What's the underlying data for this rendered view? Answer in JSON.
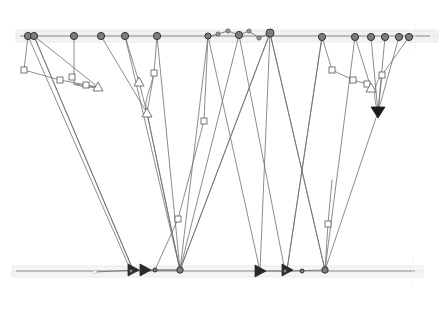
{
  "canvas": {
    "width": 440,
    "height": 311,
    "background": "#ffffff",
    "title": "node-link timeline graph"
  },
  "style": {
    "axis_fill": "#efefef",
    "axis_stroke": "#d8d8d8",
    "axis_center_line": "#8a8a8a",
    "edge_color": "#707070",
    "edge_width": 0.8,
    "node_fill": "#7d7d7d",
    "node_stroke": "#333333",
    "marker_fill": "#ffffff",
    "marker_stroke": "#555555",
    "arrow_fill": "#1a1a1a",
    "glow_color": "#f4f4f4"
  },
  "axes": [
    {
      "name": "top-axis",
      "y": 36,
      "x1": 20,
      "x2": 430,
      "band_top": 30,
      "band_height": 12,
      "label": ""
    },
    {
      "name": "bottom-axis",
      "y": 271,
      "x1": 16,
      "x2": 415,
      "band_top": 266,
      "band_height": 11,
      "label": ""
    }
  ],
  "top_nodes": [
    {
      "id": "t1",
      "x": 28,
      "y": 36,
      "r": 3.6
    },
    {
      "id": "t2",
      "x": 34,
      "y": 36,
      "r": 3.6
    },
    {
      "id": "t3",
      "x": 74,
      "y": 36,
      "r": 3.6
    },
    {
      "id": "t4",
      "x": 101,
      "y": 36,
      "r": 3.6
    },
    {
      "id": "t5",
      "x": 125,
      "y": 36,
      "r": 3.6
    },
    {
      "id": "t6",
      "x": 157,
      "y": 36,
      "r": 3.6
    },
    {
      "id": "t7",
      "x": 208,
      "y": 36,
      "r": 3.0
    },
    {
      "id": "t8",
      "x": 239,
      "y": 35,
      "r": 3.6
    },
    {
      "id": "t9",
      "x": 270,
      "y": 33,
      "r": 4.0
    },
    {
      "id": "t10",
      "x": 322,
      "y": 37,
      "r": 3.6
    },
    {
      "id": "t11",
      "x": 355,
      "y": 37,
      "r": 3.6
    },
    {
      "id": "t12",
      "x": 371,
      "y": 37,
      "r": 3.6
    },
    {
      "id": "t13",
      "x": 385,
      "y": 37,
      "r": 3.6
    },
    {
      "id": "t14",
      "x": 399,
      "y": 37,
      "r": 3.6
    },
    {
      "id": "t15",
      "x": 409,
      "y": 37,
      "r": 3.6
    }
  ],
  "bottom_nodes": [
    {
      "id": "b1",
      "x": 95,
      "y": 272,
      "r": 1.8,
      "shape": "open-circle"
    },
    {
      "id": "b2",
      "x": 131,
      "y": 271,
      "r": 2.0,
      "shape": "circle"
    },
    {
      "id": "b3",
      "x": 155,
      "y": 270,
      "r": 2.0,
      "shape": "circle"
    },
    {
      "id": "b4",
      "x": 180,
      "y": 270,
      "r": 3.2,
      "shape": "circle"
    },
    {
      "id": "b5",
      "x": 285,
      "y": 271,
      "r": 2.0,
      "shape": "circle"
    },
    {
      "id": "b6",
      "x": 302,
      "y": 271,
      "r": 2.0,
      "shape": "circle"
    },
    {
      "id": "b7",
      "x": 325,
      "y": 270,
      "r": 3.2,
      "shape": "circle"
    }
  ],
  "square_markers": [
    {
      "id": "s1",
      "x": 24,
      "y": 70
    },
    {
      "id": "s2",
      "x": 72,
      "y": 77
    },
    {
      "id": "s3",
      "x": 154,
      "y": 73
    },
    {
      "id": "s4",
      "x": 204,
      "y": 121
    },
    {
      "id": "s5",
      "x": 178,
      "y": 219
    },
    {
      "id": "s6",
      "x": 328,
      "y": 224
    },
    {
      "id": "s7",
      "x": 332,
      "y": 70
    },
    {
      "id": "s8",
      "x": 382,
      "y": 75
    },
    {
      "id": "s9",
      "x": 60,
      "y": 80
    },
    {
      "id": "s10",
      "x": 86,
      "y": 85
    },
    {
      "id": "s11",
      "x": 353,
      "y": 80
    },
    {
      "id": "s12",
      "x": 367,
      "y": 84
    }
  ],
  "triangle_markers": [
    {
      "id": "tr1",
      "x": 98,
      "y": 87,
      "style": "open"
    },
    {
      "id": "tr2",
      "x": 147,
      "y": 113,
      "style": "open"
    },
    {
      "id": "tr3",
      "x": 139,
      "y": 82,
      "style": "open"
    },
    {
      "id": "tr4",
      "x": 371,
      "y": 88,
      "style": "open"
    },
    {
      "id": "tr5",
      "x": 378,
      "y": 112,
      "style": "filled"
    },
    {
      "id": "tr6",
      "x": 133,
      "y": 270,
      "style": "filled-left"
    },
    {
      "id": "tr7",
      "x": 145,
      "y": 270,
      "style": "filled-left"
    },
    {
      "id": "tr8",
      "x": 260,
      "y": 271,
      "style": "filled-left"
    },
    {
      "id": "tr9",
      "x": 287,
      "y": 270,
      "style": "filled-left"
    }
  ],
  "edges": [
    {
      "from": [
        28,
        36
      ],
      "to": [
        24,
        70
      ]
    },
    {
      "from": [
        24,
        70
      ],
      "to": [
        60,
        80
      ]
    },
    {
      "from": [
        60,
        80
      ],
      "to": [
        86,
        85
      ]
    },
    {
      "from": [
        86,
        85
      ],
      "to": [
        98,
        87
      ]
    },
    {
      "from": [
        34,
        36
      ],
      "to": [
        98,
        87
      ]
    },
    {
      "from": [
        34,
        36
      ],
      "to": [
        133,
        270
      ]
    },
    {
      "from": [
        28,
        36
      ],
      "to": [
        131,
        271
      ]
    },
    {
      "from": [
        74,
        36
      ],
      "to": [
        74,
        84
      ]
    },
    {
      "from": [
        74,
        84
      ],
      "to": [
        98,
        87
      ]
    },
    {
      "from": [
        101,
        36
      ],
      "to": [
        147,
        113
      ]
    },
    {
      "from": [
        125,
        36
      ],
      "to": [
        139,
        82
      ]
    },
    {
      "from": [
        139,
        82
      ],
      "to": [
        147,
        113
      ]
    },
    {
      "from": [
        157,
        36
      ],
      "to": [
        154,
        73
      ]
    },
    {
      "from": [
        154,
        73
      ],
      "to": [
        147,
        113
      ]
    },
    {
      "from": [
        147,
        113
      ],
      "to": [
        180,
        270
      ]
    },
    {
      "from": [
        125,
        36
      ],
      "to": [
        180,
        270
      ]
    },
    {
      "from": [
        157,
        36
      ],
      "to": [
        180,
        270
      ]
    },
    {
      "from": [
        208,
        36
      ],
      "to": [
        180,
        270
      ]
    },
    {
      "from": [
        208,
        36
      ],
      "to": [
        204,
        121
      ]
    },
    {
      "from": [
        204,
        121
      ],
      "to": [
        178,
        219
      ]
    },
    {
      "from": [
        178,
        219
      ],
      "to": [
        155,
        270
      ]
    },
    {
      "from": [
        270,
        33
      ],
      "to": [
        180,
        270
      ]
    },
    {
      "from": [
        270,
        33
      ],
      "to": [
        260,
        271
      ]
    },
    {
      "from": [
        239,
        35
      ],
      "to": [
        285,
        271
      ]
    },
    {
      "from": [
        322,
        37
      ],
      "to": [
        332,
        70
      ]
    },
    {
      "from": [
        332,
        70
      ],
      "to": [
        353,
        80
      ]
    },
    {
      "from": [
        353,
        80
      ],
      "to": [
        367,
        84
      ]
    },
    {
      "from": [
        367,
        84
      ],
      "to": [
        371,
        88
      ]
    },
    {
      "from": [
        355,
        37
      ],
      "to": [
        371,
        88
      ]
    },
    {
      "from": [
        371,
        37
      ],
      "to": [
        378,
        112
      ]
    },
    {
      "from": [
        385,
        37
      ],
      "to": [
        378,
        112
      ]
    },
    {
      "from": [
        399,
        37
      ],
      "to": [
        378,
        112
      ]
    },
    {
      "from": [
        409,
        37
      ],
      "to": [
        382,
        75
      ]
    },
    {
      "from": [
        382,
        75
      ],
      "to": [
        378,
        112
      ]
    },
    {
      "from": [
        322,
        37
      ],
      "to": [
        287,
        270
      ]
    },
    {
      "from": [
        355,
        37
      ],
      "to": [
        325,
        270
      ]
    },
    {
      "from": [
        378,
        112
      ],
      "to": [
        325,
        270
      ]
    },
    {
      "from": [
        328,
        224
      ],
      "to": [
        325,
        270
      ]
    },
    {
      "from": [
        328,
        224
      ],
      "to": [
        332,
        180
      ]
    },
    {
      "from": [
        270,
        33
      ],
      "to": [
        325,
        270
      ]
    },
    {
      "from": [
        285,
        271
      ],
      "to": [
        325,
        270
      ]
    },
    {
      "from": [
        260,
        271
      ],
      "to": [
        285,
        271
      ]
    },
    {
      "from": [
        133,
        270
      ],
      "to": [
        180,
        270
      ]
    },
    {
      "from": [
        145,
        270
      ],
      "to": [
        180,
        270
      ]
    },
    {
      "from": [
        95,
        272
      ],
      "to": [
        133,
        270
      ]
    }
  ],
  "top_chain": {
    "name": "upper-zigzag-chain",
    "points": [
      [
        207,
        37
      ],
      [
        218,
        34
      ],
      [
        228,
        31
      ],
      [
        239,
        35
      ],
      [
        249,
        31
      ],
      [
        259,
        38
      ],
      [
        270,
        33
      ]
    ]
  },
  "curves": [
    {
      "name": "curve-left",
      "d": "M154,73 C150,92 143,100 147,113"
    },
    {
      "name": "curve-right",
      "d": "M382,75 C372,86 374,100 378,112"
    },
    {
      "name": "curve-mid",
      "d": "M74,84 C82,87 90,88 98,87"
    }
  ],
  "long_edges": [
    {
      "from": [
        34,
        36
      ],
      "to": [
        133,
        270
      ]
    },
    {
      "from": [
        147,
        113
      ],
      "to": [
        180,
        270
      ]
    },
    {
      "from": [
        208,
        36
      ],
      "to": [
        260,
        271
      ]
    },
    {
      "from": [
        239,
        35
      ],
      "to": [
        180,
        270
      ]
    },
    {
      "from": [
        270,
        33
      ],
      "to": [
        180,
        270
      ]
    },
    {
      "from": [
        270,
        33
      ],
      "to": [
        325,
        270
      ]
    },
    {
      "from": [
        322,
        37
      ],
      "to": [
        287,
        270
      ]
    }
  ]
}
